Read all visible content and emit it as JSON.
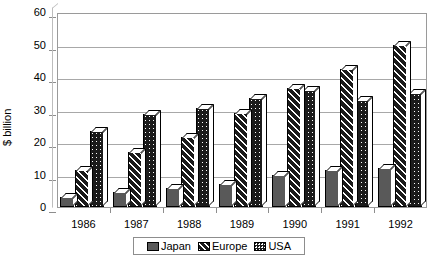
{
  "chart_data": {
    "type": "bar",
    "title": "",
    "xlabel": "",
    "ylabel": "$ billion",
    "categories": [
      "1986",
      "1987",
      "1988",
      "1989",
      "1990",
      "1991",
      "1992"
    ],
    "series": [
      {
        "name": "Japan",
        "values": [
          3,
          4.5,
          6,
          7,
          10,
          11.5,
          12
        ]
      },
      {
        "name": "Europe",
        "values": [
          11.5,
          17,
          21.5,
          29,
          36.5,
          42.5,
          50
        ]
      },
      {
        "name": "USA",
        "values": [
          23.5,
          28.5,
          30.5,
          33.5,
          36,
          33,
          35
        ]
      }
    ],
    "ylim": [
      0,
      60
    ],
    "yticks": [
      0,
      10,
      20,
      30,
      40,
      50,
      60
    ],
    "ytick_labels": [
      "0",
      "10",
      "20",
      "30",
      "40",
      "50",
      "60"
    ],
    "grid": true,
    "legend_position": "bottom",
    "legend_entries": [
      "Japan",
      "Europe",
      "USA"
    ],
    "colors": {
      "japan": "#595959",
      "europe": "#1b1b1b",
      "usa": "#1b1b1b",
      "axis": "#8d8d8d",
      "grid": "#a8a8a8",
      "background": "#ffffff"
    }
  }
}
